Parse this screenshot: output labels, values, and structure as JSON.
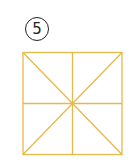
{
  "figure": {
    "number_label": "5",
    "grid_color": "#E8B84A"
  }
}
